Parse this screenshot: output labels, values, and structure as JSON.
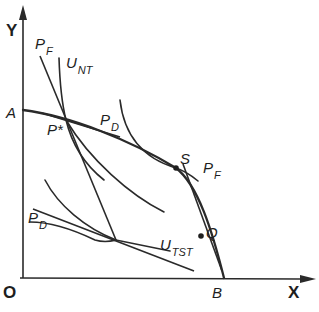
{
  "diagram": {
    "axes": {
      "y_label": "Y",
      "x_label": "X",
      "origin_label": "O"
    },
    "points": {
      "A": "A",
      "B": "B",
      "P_star": "P*",
      "S": "S",
      "Q": "Q"
    },
    "curves": {
      "P_F_upper": {
        "main": "P",
        "sub": "F"
      },
      "U_NT": {
        "main": "U",
        "sub": "NT"
      },
      "P_D_upper": {
        "main": "P",
        "sub": "D"
      },
      "P_F_lower": {
        "main": "P",
        "sub": "F"
      },
      "P_D_lower": {
        "main": "P",
        "sub": "D"
      },
      "U_TST": {
        "main": "U",
        "sub": "TST"
      }
    },
    "line_color": "#2a2a2a"
  }
}
